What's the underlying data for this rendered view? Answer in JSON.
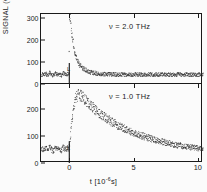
{
  "figure": {
    "y_axis_title": "SIGNAL  (COUNTS)",
    "x_axis_title_main": "t  [10",
    "x_axis_title_exp": "-6",
    "x_axis_title_tail": "s]"
  },
  "chart_data": {
    "type": "line",
    "title": "",
    "xlabel": "t [10^-6 s]",
    "ylabel": "SIGNAL (COUNTS)",
    "grid": false,
    "legend": "none",
    "xlim": [
      -2.2,
      10.4
    ],
    "x_ticks": [
      "0",
      "5",
      "10"
    ],
    "x_tick_values": [
      0,
      5,
      10
    ],
    "panels": [
      {
        "name": "top-panel",
        "annotation": "ν = 2.0 THz",
        "frequency_THz": 2.0,
        "ylim": [
          0,
          318
        ],
        "y_ticks": [
          "0",
          "100",
          "200",
          "300"
        ],
        "y_tick_values": [
          0,
          100,
          200,
          300
        ],
        "baseline_counts": 45,
        "peak_counts": 330,
        "peak_time": 0.05,
        "decay_note": "fast decay to baseline by t~2",
        "origin_marker": "L",
        "series": [
          {
            "name": "signal-2.0THz",
            "x": [
              -2.0,
              -1.85,
              -1.7,
              -1.55,
              -1.4,
              -1.25,
              -1.1,
              -0.95,
              -0.8,
              -0.65,
              -0.5,
              -0.35,
              -0.2,
              -0.05,
              0.0,
              0.05,
              0.1,
              0.15,
              0.2,
              0.25,
              0.3,
              0.35,
              0.4,
              0.45,
              0.5,
              0.55,
              0.6,
              0.65,
              0.7,
              0.75,
              0.8,
              0.9,
              1.0,
              1.1,
              1.2,
              1.3,
              1.4,
              1.5,
              1.6,
              1.8,
              2.0,
              2.2,
              2.4,
              2.6,
              2.8,
              3.0,
              3.3,
              3.6,
              3.9,
              4.2,
              4.5,
              4.8,
              5.1,
              5.4,
              5.7,
              6.0,
              6.3,
              6.6,
              6.9,
              7.2,
              7.5,
              7.8,
              8.1,
              8.4,
              8.7,
              9.0,
              9.3,
              9.6,
              9.9,
              10.2
            ],
            "y": [
              44,
              49,
              41,
              52,
              45,
              38,
              50,
              43,
              47,
              40,
              51,
              44,
              46,
              48,
              300,
              330,
              262,
              238,
              215,
              196,
              178,
              162,
              148,
              136,
              124,
              115,
              107,
              100,
              94,
              89,
              85,
              79,
              74,
              70,
              66,
              63,
              60,
              58,
              56,
              53,
              51,
              49,
              48,
              47,
              46,
              46,
              45,
              45,
              44,
              45,
              44,
              45,
              44,
              45,
              44,
              45,
              44,
              45,
              44,
              45,
              44,
              45,
              44,
              45,
              44,
              45,
              44,
              45,
              44,
              45
            ]
          }
        ]
      },
      {
        "name": "bottom-panel",
        "annotation": "ν = 1.0 THz",
        "frequency_THz": 1.0,
        "ylim": [
          0,
          290
        ],
        "y_ticks": [
          "0",
          "100",
          "200"
        ],
        "y_tick_values": [
          0,
          100,
          200
        ],
        "baseline_counts": 52,
        "peak_counts": 252,
        "peak_time": 0.85,
        "decay_note": "slow decay from peak to ~55 at t=10",
        "origin_marker": "L",
        "series": [
          {
            "name": "signal-1.0THz",
            "x": [
              -2.0,
              -1.85,
              -1.7,
              -1.55,
              -1.4,
              -1.25,
              -1.1,
              -0.95,
              -0.8,
              -0.65,
              -0.5,
              -0.35,
              -0.2,
              -0.05,
              0.05,
              0.15,
              0.25,
              0.35,
              0.45,
              0.55,
              0.65,
              0.75,
              0.85,
              0.95,
              1.05,
              1.2,
              1.35,
              1.5,
              1.65,
              1.8,
              2.0,
              2.2,
              2.4,
              2.6,
              2.8,
              3.0,
              3.2,
              3.4,
              3.6,
              3.8,
              4.0,
              4.3,
              4.6,
              4.9,
              5.2,
              5.5,
              5.8,
              6.1,
              6.4,
              6.7,
              7.0,
              7.3,
              7.6,
              7.9,
              8.2,
              8.5,
              8.8,
              9.1,
              9.4,
              9.7,
              10.0,
              10.2
            ],
            "y": [
              52,
              57,
              48,
              60,
              50,
              45,
              58,
              51,
              55,
              47,
              59,
              52,
              54,
              56,
              95,
              150,
              192,
              218,
              236,
              246,
              251,
              252,
              250,
              246,
              241,
              234,
              227,
              220,
              213,
              206,
              197,
              189,
              181,
              174,
              167,
              161,
              155,
              149,
              144,
              139,
              134,
              127,
              120,
              114,
              108,
              103,
              98,
              93,
              89,
              85,
              81,
              78,
              74,
              71,
              68,
              66,
              63,
              61,
              59,
              57,
              56,
              55
            ]
          }
        ]
      }
    ]
  }
}
